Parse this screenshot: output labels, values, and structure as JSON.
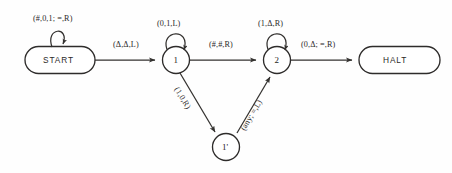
{
  "diagram": {
    "background_color": "#fefefe",
    "ink_color": "#33312f",
    "nodes": [
      {
        "id": "start",
        "label": "START",
        "shape": "stadium",
        "cx": 60,
        "cy": 60
      },
      {
        "id": "s1",
        "label": "1",
        "shape": "circle",
        "cx": 176,
        "cy": 60
      },
      {
        "id": "s2",
        "label": "2",
        "shape": "circle",
        "cx": 277,
        "cy": 60
      },
      {
        "id": "s1p",
        "label": "1'",
        "shape": "circle",
        "cx": 226,
        "cy": 147
      },
      {
        "id": "halt",
        "label": "HALT",
        "shape": "stadium",
        "cx": 399,
        "cy": 60
      }
    ],
    "edges": [
      {
        "id": "e-start-loop",
        "from": "start",
        "to": "start",
        "kind": "self-loop",
        "label": "(#,0,1; =,R)"
      },
      {
        "id": "e-start-1",
        "from": "start",
        "to": "s1",
        "kind": "straight",
        "label": "(Δ,Δ,L)"
      },
      {
        "id": "e-1-loop",
        "from": "s1",
        "to": "s1",
        "kind": "self-loop",
        "label": "(0,1,L)"
      },
      {
        "id": "e-1-2",
        "from": "s1",
        "to": "s2",
        "kind": "straight",
        "label": "(#,#,R)"
      },
      {
        "id": "e-2-loop",
        "from": "s2",
        "to": "s2",
        "kind": "self-loop",
        "label": "(1,Δ,R)"
      },
      {
        "id": "e-2-halt",
        "from": "s2",
        "to": "halt",
        "kind": "straight",
        "label": "(0,Δ; =,R)"
      },
      {
        "id": "e-1-1p",
        "from": "s1",
        "to": "s1p",
        "kind": "diagonal",
        "label": "(1,0,R)"
      },
      {
        "id": "e-1p-2",
        "from": "s1p",
        "to": "s2",
        "kind": "diagonal",
        "label": "(any; =,L)"
      }
    ]
  }
}
